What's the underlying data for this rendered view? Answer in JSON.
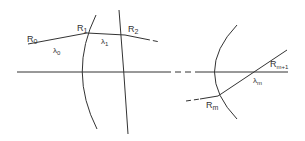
{
  "diagram": {
    "type": "optical-ray-trace",
    "labels": {
      "r0": "R",
      "r0_sub": "0",
      "r1": "R",
      "r1_sub": "1",
      "r2": "R",
      "r2_sub": "2",
      "rm": "R",
      "rm_sub": "m",
      "rm1": "R",
      "rm1_sub": "m+1",
      "l0": "λ",
      "l0_sub": "0",
      "l1": "λ",
      "l1_sub": "1",
      "lm": "λ",
      "lm_sub": "m"
    },
    "colors": {
      "line": "#333333",
      "background": "#ffffff"
    }
  }
}
